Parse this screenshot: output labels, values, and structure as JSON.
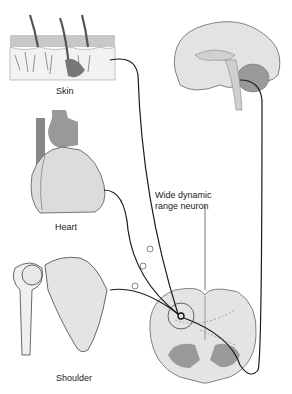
{
  "diagram": {
    "type": "anatomical referred-pain pathway",
    "labels": {
      "skin": "Skin",
      "heart": "Heart",
      "shoulder": "Shoulder",
      "neuron_line1": "Wide dynamic",
      "neuron_line2": "range neuron"
    },
    "structures": [
      "skin",
      "heart",
      "shoulder",
      "brain",
      "spinal-cord-section",
      "wide-dynamic-range-neuron"
    ],
    "synapse_symbol": "+",
    "colors": {
      "line": "#1a1a1a",
      "tissue_light": "#e6e6e6",
      "tissue_mid": "#bdbdbd",
      "tissue_dark": "#8a8a8a"
    }
  }
}
